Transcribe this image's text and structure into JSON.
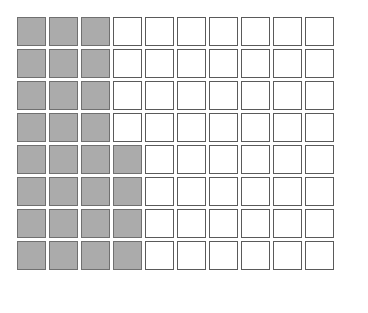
{
  "figure": {
    "name": "fraction-area-grid",
    "background_color": "#ffffff"
  },
  "grid": {
    "columns": 10,
    "rows": 8,
    "total_cells": 80,
    "shaded_cells": 28,
    "unshaded_cells": 52,
    "cell_size_px": 29,
    "cell_gap_px": 3,
    "origin_x_px": 17,
    "origin_y_px": 17
  },
  "colors": {
    "shaded_fill": "#ababab",
    "unshaded_fill": "#ffffff",
    "cell_border": "#5a5a5a",
    "shaded_cell_border": "#707070"
  },
  "shading_by_row": [
    3,
    3,
    3,
    4,
    4,
    4,
    4,
    4
  ],
  "cells": [
    [
      1,
      1,
      1,
      0,
      0,
      0,
      0,
      0,
      0,
      0
    ],
    [
      1,
      1,
      1,
      0,
      0,
      0,
      0,
      0,
      0,
      0
    ],
    [
      1,
      1,
      1,
      0,
      0,
      0,
      0,
      0,
      0,
      0
    ],
    [
      1,
      1,
      1,
      0,
      0,
      0,
      0,
      0,
      0,
      0
    ],
    [
      1,
      1,
      1,
      1,
      0,
      0,
      0,
      0,
      0,
      0
    ],
    [
      1,
      1,
      1,
      1,
      0,
      0,
      0,
      0,
      0,
      0
    ],
    [
      1,
      1,
      1,
      1,
      0,
      0,
      0,
      0,
      0,
      0
    ],
    [
      1,
      1,
      1,
      1,
      0,
      0,
      0,
      0,
      0,
      0
    ]
  ]
}
